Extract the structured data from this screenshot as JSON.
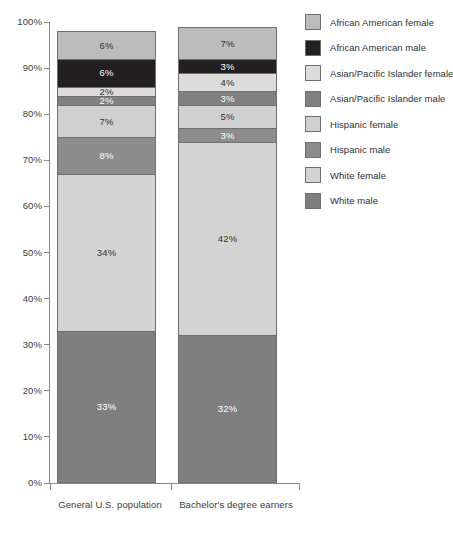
{
  "chart_data": {
    "type": "bar",
    "subtype": "stacked-percentage",
    "title": "",
    "subtitle": "",
    "xlabel": "",
    "ylabel": "",
    "ylim": [
      0,
      100
    ],
    "grid": false,
    "legend_position": "right",
    "y_ticks": [
      "0%",
      "10%",
      "20%",
      "30%",
      "40%",
      "50%",
      "60%",
      "70%",
      "80%",
      "90%",
      "100%"
    ],
    "y_tick_values": [
      0,
      10,
      20,
      30,
      40,
      50,
      60,
      70,
      80,
      90,
      100
    ],
    "categories": [
      "General U.S. population",
      "Bachelor's degree earners"
    ],
    "series": [
      {
        "name": "White male",
        "values": [
          33,
          32
        ],
        "color": "#7f7f7f",
        "label_color": "#ffffff"
      },
      {
        "name": "White female",
        "values": [
          34,
          42
        ],
        "color": "#d4d4d4",
        "label_color": "#333333"
      },
      {
        "name": "Hispanic male",
        "values": [
          8,
          3
        ],
        "color": "#8c8c8c",
        "label_color": "#ffffff"
      },
      {
        "name": "Hispanic female",
        "values": [
          7,
          5
        ],
        "color": "#d0d0d0",
        "label_color": "#333333"
      },
      {
        "name": "Asian/Pacific Islander male",
        "values": [
          2,
          3
        ],
        "color": "#808080",
        "label_color": "#ffffff"
      },
      {
        "name": "Asian/Pacific Islander female",
        "values": [
          2,
          4
        ],
        "color": "#dcdcdc",
        "label_color": "#333333"
      },
      {
        "name": "African American male",
        "values": [
          6,
          3
        ],
        "color": "#231f20",
        "label_color": "#ffffff"
      },
      {
        "name": "African American female",
        "values": [
          6,
          7
        ],
        "color": "#bcbcbc",
        "label_color": "#333333"
      }
    ],
    "data_labels": {
      "General U.S. population": [
        "6%",
        "6%",
        "2%",
        "2%",
        "7%",
        "8%",
        "34%",
        "33%"
      ],
      "Bachelor's degree earners": [
        "7%",
        "3%",
        "4%",
        "3%",
        "5%",
        "3%",
        "42%",
        "32%"
      ]
    },
    "stack_order_top_to_bottom": [
      "African American female",
      "African American male",
      "Asian/Pacific Islander female",
      "Asian/Pacific Islander male",
      "Hispanic female",
      "Hispanic male",
      "White female",
      "White male"
    ]
  },
  "legend": {
    "items": [
      {
        "label": "African American female",
        "color": "#bcbcbc"
      },
      {
        "label": "African American male",
        "color": "#231f20"
      },
      {
        "label": "Asian/Pacific Islander female",
        "color": "#dcdcdc"
      },
      {
        "label": "Asian/Pacific Islander male",
        "color": "#808080"
      },
      {
        "label": "Hispanic female",
        "color": "#d0d0d0"
      },
      {
        "label": "Hispanic male",
        "color": "#8c8c8c"
      },
      {
        "label": "White female",
        "color": "#d4d4d4"
      },
      {
        "label": "White male",
        "color": "#7f7f7f"
      }
    ]
  },
  "axes": {
    "y_tick_labels": [
      "100%",
      "90%",
      "80%",
      "70%",
      "60%",
      "50%",
      "40%",
      "30%",
      "20%",
      "10%",
      "0%"
    ],
    "x_tick_labels": [
      "General U.S. population",
      "Bachelor's degree earners"
    ]
  }
}
